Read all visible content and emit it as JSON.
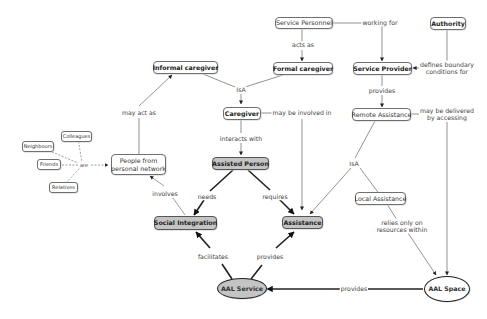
{
  "diagram": {
    "type": "concept-map",
    "nodes": {
      "service_personnel": "Service Personnel",
      "authority": "Authority",
      "informal_caregiver": "Informal caregiver",
      "formal_caregiver": "Formal caregiver",
      "service_provider": "Service Provider",
      "caregiver": "Caregiver",
      "remote_assistance": "Remote Assistance",
      "colleagues": "Colleagues",
      "neighbours": "Neighbours",
      "friends": "Friends",
      "relatives": "Relatives",
      "people_network_line1": "People from",
      "people_network_line2": "personal network",
      "assisted_person": "Assisted Person",
      "local_assistance": "Local Assistance",
      "social_integration": "Social Integration",
      "assistance": "Assistance",
      "aal_service": "AAL Service",
      "aal_space": "AAL Space"
    },
    "links": {
      "working_for": "working for",
      "acts_as": "acts as",
      "defines_line1": "defines boundary",
      "defines_line2": "conditions for",
      "isa_caregiver": "IsA",
      "provides_remote": "provides",
      "may_act_as": "may act as",
      "may_be_involved_in": "may be involved in",
      "delivered_line1": "may be delivered",
      "delivered_line2": "by accessing",
      "interacts_with": "interacts with",
      "are": "are",
      "isa_assistance": "IsA",
      "involves": "involves",
      "needs": "needs",
      "requires": "requires",
      "relies_line1": "relies only on",
      "relies_line2": "resources within",
      "facilitates": "facilitates",
      "provides_assistance": "provides",
      "provides_service": "provides"
    },
    "relations": [
      [
        "Service Personnel",
        "working for",
        "Service Provider"
      ],
      [
        "Service Personnel",
        "acts as",
        "Formal caregiver"
      ],
      [
        "Authority",
        "defines boundary conditions for",
        "Service Provider"
      ],
      [
        "Informal caregiver",
        "IsA",
        "Caregiver"
      ],
      [
        "Formal caregiver",
        "IsA",
        "Caregiver"
      ],
      [
        "Service Provider",
        "provides",
        "Remote Assistance"
      ],
      [
        "People from personal network",
        "may act as",
        "Informal caregiver"
      ],
      [
        "Caregiver",
        "may be involved in",
        "Assistance"
      ],
      [
        "Caregiver",
        "interacts with",
        "Assisted Person"
      ],
      [
        "Remote Assistance",
        "may be delivered by accessing",
        "AAL Space"
      ],
      [
        "Colleagues/Neighbours/Friends/Relatives",
        "are",
        "People from personal network"
      ],
      [
        "Remote Assistance",
        "IsA",
        "Assistance"
      ],
      [
        "Local Assistance",
        "IsA",
        "Assistance"
      ],
      [
        "Social Integration",
        "involves",
        "People from personal network"
      ],
      [
        "Assisted Person",
        "needs",
        "Social Integration"
      ],
      [
        "Assisted Person",
        "requires",
        "Assistance"
      ],
      [
        "Local Assistance",
        "relies only on resources within",
        "AAL Space"
      ],
      [
        "AAL Service",
        "facilitates",
        "Social Integration"
      ],
      [
        "AAL Service",
        "provides",
        "Assistance"
      ],
      [
        "AAL Space",
        "provides",
        "AAL Service"
      ]
    ]
  }
}
